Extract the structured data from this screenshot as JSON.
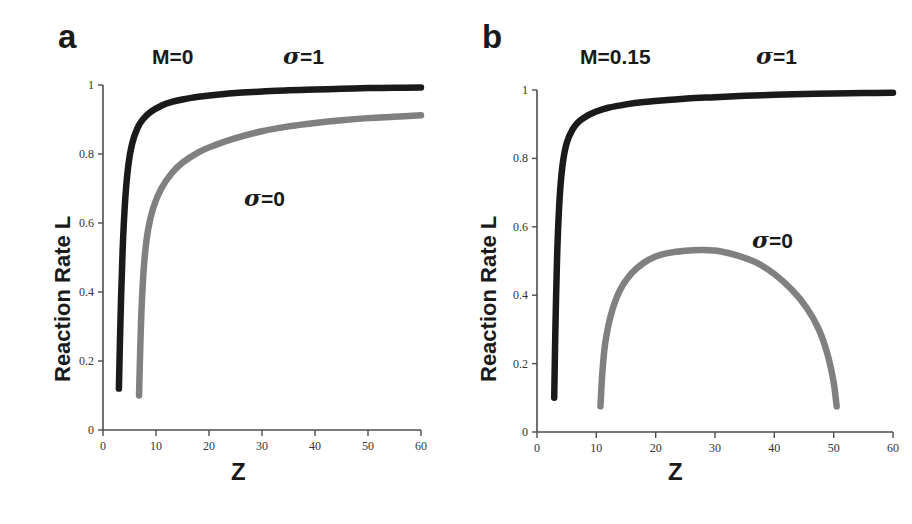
{
  "figure": {
    "background": "#ffffff",
    "series_colors": {
      "sigma1": "#1a1a1a",
      "sigma0": "#808080"
    },
    "axis_color": "#4d4d4d"
  },
  "panels": [
    {
      "letter": "a",
      "annotations": {
        "M": "M=0",
        "sigma_top": "σ=1",
        "sigma_lower": "σ=0"
      },
      "xlabel": "Z",
      "ylabel": "Reaction Rate L",
      "xticks": [
        "0",
        "10",
        "20",
        "30",
        "40",
        "50",
        "60"
      ],
      "yticks": [
        "0",
        "0.2",
        "0.4",
        "0.6",
        "0.8",
        "1"
      ]
    },
    {
      "letter": "b",
      "annotations": {
        "M": "M=0.15",
        "sigma_top": "σ=1",
        "sigma_lower": "σ=0"
      },
      "xlabel": "Z",
      "ylabel": "Reaction Rate L",
      "xticks": [
        "0",
        "10",
        "20",
        "30",
        "40",
        "50",
        "60"
      ],
      "yticks": [
        "0",
        "0.2",
        "0.4",
        "0.6",
        "0.8",
        "1"
      ]
    }
  ],
  "chart_data": [
    {
      "type": "line",
      "panel": "a",
      "title": "M=0",
      "xlabel": "Z",
      "ylabel": "Reaction Rate L",
      "xlim": [
        0,
        60
      ],
      "ylim": [
        0,
        1
      ],
      "xticks": [
        0,
        10,
        20,
        30,
        40,
        50,
        60
      ],
      "yticks": [
        0,
        0.2,
        0.4,
        0.6,
        0.8,
        1
      ],
      "grid": false,
      "legend": "inline-annotations",
      "series": [
        {
          "name": "σ=1",
          "color": "#1a1a1a",
          "x": [
            3.0,
            3.3,
            3.7,
            4.2,
            4.8,
            5.5,
            6.5,
            7.5,
            9.0,
            11.0,
            13.0,
            15.0,
            18.0,
            21.0,
            25.0,
            30.0,
            35.0,
            40.0,
            45.0,
            50.0,
            55.0,
            60.0
          ],
          "y": [
            0.12,
            0.32,
            0.52,
            0.67,
            0.77,
            0.83,
            0.875,
            0.9,
            0.922,
            0.94,
            0.951,
            0.958,
            0.966,
            0.971,
            0.977,
            0.981,
            0.985,
            0.987,
            0.989,
            0.991,
            0.992,
            0.993
          ]
        },
        {
          "name": "σ=0",
          "color": "#808080",
          "x": [
            6.8,
            7.0,
            7.3,
            7.8,
            8.5,
            9.5,
            11.0,
            13.0,
            15.0,
            18.0,
            21.0,
            25.0,
            30.0,
            35.0,
            40.0,
            45.0,
            50.0,
            55.0,
            60.0
          ],
          "y": [
            0.1,
            0.22,
            0.36,
            0.49,
            0.58,
            0.645,
            0.7,
            0.745,
            0.775,
            0.805,
            0.825,
            0.846,
            0.866,
            0.88,
            0.89,
            0.898,
            0.904,
            0.908,
            0.912
          ]
        }
      ]
    },
    {
      "type": "line",
      "panel": "b",
      "title": "M=0.15",
      "xlabel": "Z",
      "ylabel": "Reaction Rate L",
      "xlim": [
        0,
        60
      ],
      "ylim": [
        0,
        1
      ],
      "xticks": [
        0,
        10,
        20,
        30,
        40,
        50,
        60
      ],
      "yticks": [
        0,
        0.2,
        0.4,
        0.6,
        0.8,
        1
      ],
      "grid": false,
      "legend": "inline-annotations",
      "series": [
        {
          "name": "σ=1",
          "color": "#1a1a1a",
          "x": [
            2.9,
            3.1,
            3.4,
            3.8,
            4.3,
            5.0,
            6.0,
            7.0,
            8.5,
            10.0,
            12.0,
            15.0,
            18.0,
            22.0,
            26.0,
            30.0,
            35.0,
            40.0,
            45.0,
            50.0,
            55.0,
            60.0
          ],
          "y": [
            0.1,
            0.3,
            0.52,
            0.68,
            0.78,
            0.845,
            0.885,
            0.907,
            0.925,
            0.937,
            0.948,
            0.958,
            0.965,
            0.971,
            0.976,
            0.979,
            0.983,
            0.986,
            0.988,
            0.99,
            0.991,
            0.992
          ]
        },
        {
          "name": "σ=0",
          "color": "#808080",
          "x": [
            10.7,
            11.0,
            11.5,
            12.5,
            14.0,
            16.0,
            18.0,
            20.0,
            22.0,
            25.0,
            28.0,
            31.0,
            34.0,
            37.0,
            40.0,
            43.0,
            45.5,
            47.5,
            49.0,
            50.0,
            50.5
          ],
          "y": [
            0.075,
            0.17,
            0.26,
            0.345,
            0.415,
            0.465,
            0.495,
            0.513,
            0.523,
            0.53,
            0.532,
            0.528,
            0.515,
            0.495,
            0.462,
            0.415,
            0.362,
            0.3,
            0.225,
            0.145,
            0.075
          ]
        }
      ]
    }
  ]
}
